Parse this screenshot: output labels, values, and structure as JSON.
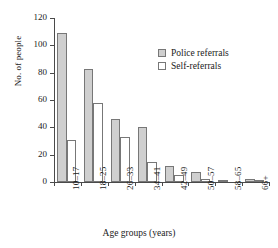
{
  "chart_data": {
    "type": "bar",
    "title": "",
    "xlabel": "Age groups (years)",
    "ylabel": "No. of people",
    "categories": [
      "10–17",
      "18–25",
      "26–33",
      "34–41",
      "42–49",
      "50–57",
      "58–65",
      "66+"
    ],
    "series": [
      {
        "name": "Police referrals",
        "color": "#cfcfcf",
        "values": [
          109,
          83,
          46,
          40,
          12,
          7,
          1,
          2
        ]
      },
      {
        "name": "Self-referrals",
        "color": "#ffffff",
        "values": [
          31,
          58,
          33,
          15,
          5,
          2,
          0,
          1
        ]
      }
    ],
    "ylim": [
      0,
      120
    ],
    "yticks": [
      0,
      20,
      40,
      60,
      80,
      100,
      120
    ],
    "grid": false,
    "legend_position": "upper right"
  },
  "legend": {
    "entries": [
      {
        "label": "Police referrals",
        "swatch": "#cfcfcf"
      },
      {
        "label": "Self-referrals",
        "swatch": "#ffffff"
      }
    ]
  },
  "axes": {
    "y_title": "No. of people",
    "x_title": "Age groups (years)",
    "y_tick_labels": [
      "0",
      "20",
      "40",
      "60",
      "80",
      "100",
      "120"
    ]
  }
}
